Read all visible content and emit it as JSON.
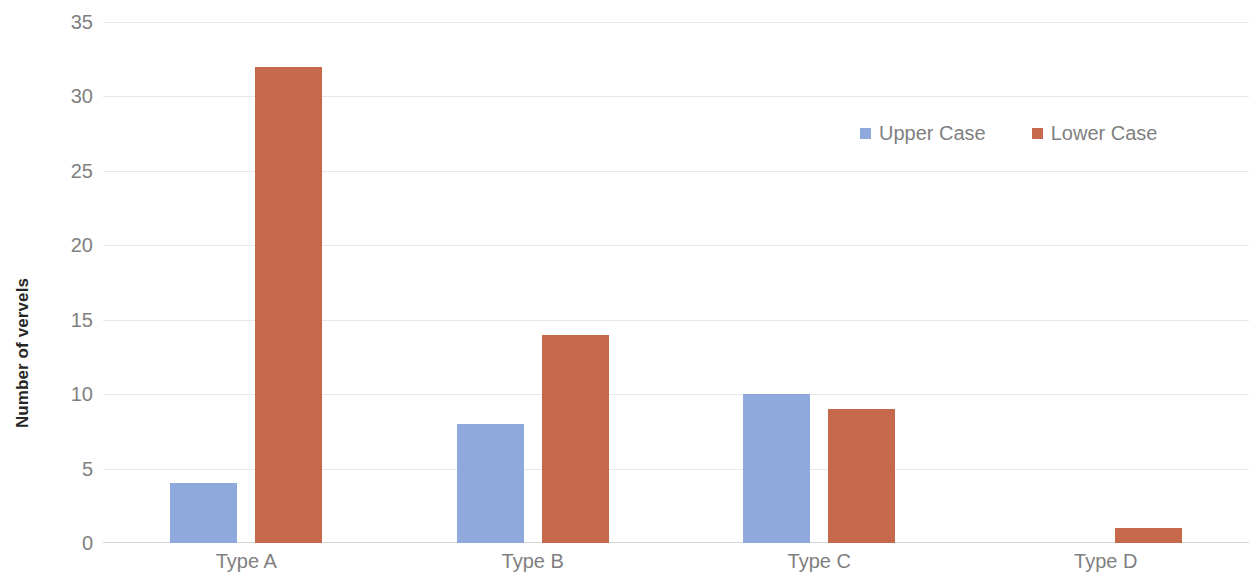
{
  "chart_data": {
    "type": "bar",
    "title": "",
    "subtitle": "",
    "xlabel": "",
    "ylabel": "Number of vervels",
    "categories": [
      "Type A",
      "Type B",
      "Type C",
      "Type D"
    ],
    "series": [
      {
        "name": "Upper Case",
        "color": "#8fa9dc",
        "values": [
          4,
          8,
          10,
          0
        ]
      },
      {
        "name": "Lower Case",
        "color": "#c5684b",
        "values": [
          32,
          14,
          9,
          1
        ]
      }
    ],
    "ylim": [
      0,
      35
    ],
    "ytick_step": 5,
    "ytick_labels": [
      "35",
      "30",
      "25",
      "20",
      "15",
      "10",
      "5",
      "0"
    ],
    "ytick_values": [
      35,
      30,
      25,
      20,
      15,
      10,
      5,
      0
    ],
    "grid": true,
    "grid_axis": "y",
    "legend": {
      "position": "top-right",
      "entries": [
        {
          "label": "Upper Case",
          "color": "#8fa9dc"
        },
        {
          "label": "Lower Case",
          "color": "#c5684b"
        }
      ]
    },
    "colors": {
      "upper_case": "#8fa9dc",
      "lower_case": "#c5684b",
      "gridline": "#e8e8e8",
      "tick_text": "#7f7f7f",
      "axis_title_text": "#262626",
      "background": "#ffffff"
    },
    "bar_group_order": [
      "Upper Case",
      "Lower Case"
    ]
  }
}
